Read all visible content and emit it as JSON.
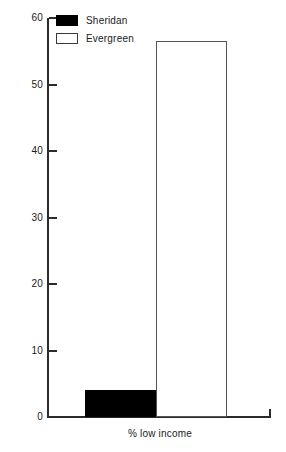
{
  "chart_data": {
    "type": "bar",
    "title": "",
    "subtitle": "",
    "xlabel": "% low income",
    "ylabel": "",
    "categories": [
      "% low income"
    ],
    "series": [
      {
        "name": "Sheridan",
        "values": [
          4
        ],
        "color": "#000000",
        "swatch": "filled"
      },
      {
        "name": "Evergreen",
        "values": [
          56.5
        ],
        "color": "#ffffff",
        "swatch": "outlined"
      }
    ],
    "ylim": [
      0,
      60
    ],
    "ytick_values": [
      60,
      50,
      40,
      30,
      20,
      10,
      0
    ],
    "ytick_labels": [
      "60",
      "50",
      "40",
      "30",
      "20",
      "10",
      "0"
    ],
    "grid": false,
    "legend_position": "top-left",
    "annotations": []
  },
  "legend": {
    "items": [
      {
        "label": "Sheridan"
      },
      {
        "label": "Evergreen"
      }
    ]
  },
  "axis": {
    "x_label": "% low income",
    "ticks": [
      {
        "label": "60"
      },
      {
        "label": "50"
      },
      {
        "label": "40"
      },
      {
        "label": "30"
      },
      {
        "label": "20"
      },
      {
        "label": "10"
      },
      {
        "label": "0"
      }
    ]
  }
}
